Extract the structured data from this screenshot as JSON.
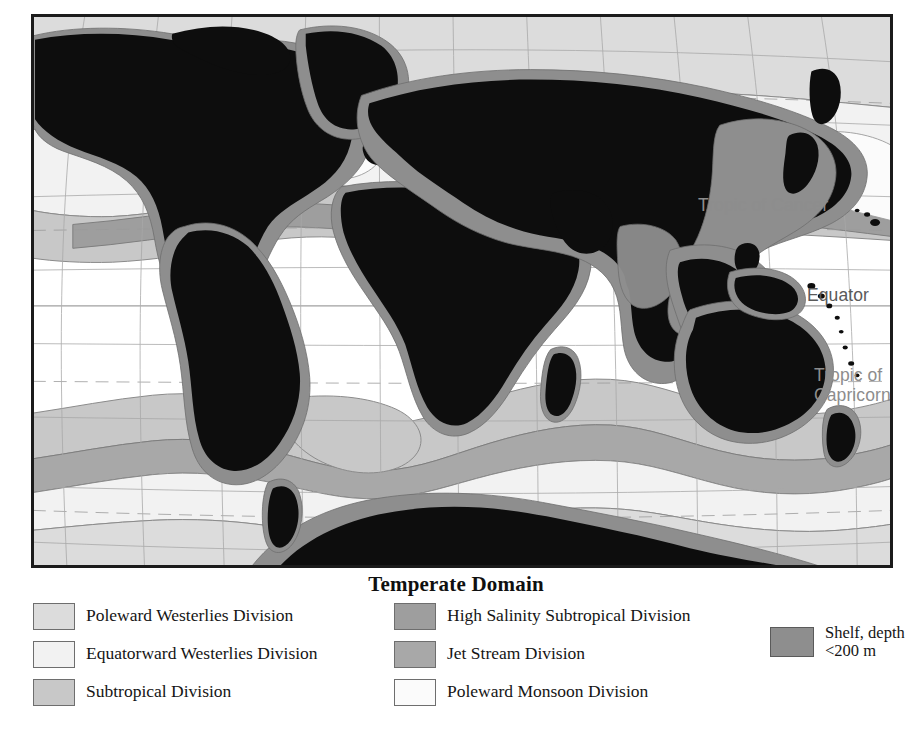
{
  "title": "Temperate Domain",
  "map": {
    "annotations": [
      {
        "id": "tropic-of-cancer",
        "text": "Tropic of Cancer"
      },
      {
        "id": "equator",
        "text": "Equator"
      },
      {
        "id": "tropic-of-capricorn",
        "text": "Tropic of\nCapricorn"
      }
    ],
    "colors": {
      "land": "#0d0d0d",
      "shelf": "#8e8e8e",
      "poleward_westerlies": "#dcdcdc",
      "equatorward_westerlies": "#f2f2f2",
      "subtropical": "#c8c8c8",
      "high_salinity_subtropical": "#9e9e9e",
      "jet_stream": "#a8a8a8",
      "poleward_monsoon": "#fbfbfb",
      "open_ocean": "#ffffff",
      "graticule": "#a9a9a9",
      "outline": "#6e6e6e",
      "frame": "#1b1b1b",
      "label": "#8d8d8d"
    }
  },
  "legend": {
    "columns": [
      {
        "id": "column-1",
        "items": [
          {
            "label": "Poleward Westerlies Division",
            "color": "#dcdcdc"
          },
          {
            "label": "Equatorward Westerlies Division",
            "color": "#f2f2f2"
          },
          {
            "label": "Subtropical Division",
            "color": "#c8c8c8"
          }
        ]
      },
      {
        "id": "column-2",
        "items": [
          {
            "label": "High Salinity Subtropical Division",
            "color": "#9e9e9e"
          },
          {
            "label": "Jet Stream Division",
            "color": "#a8a8a8"
          },
          {
            "label": "Poleward Monsoon Division",
            "color": "#fbfbfb"
          }
        ]
      },
      {
        "id": "column-3",
        "items": [
          {
            "label": "Shelf, depth\n<200 m",
            "color": "#8e8e8e"
          }
        ]
      }
    ]
  }
}
